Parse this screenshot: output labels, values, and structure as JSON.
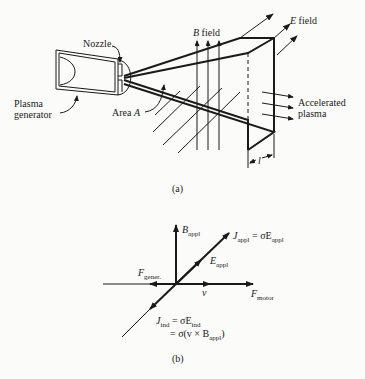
{
  "figure_a": {
    "caption": "(a)",
    "labels": {
      "nozzle": "Nozzle",
      "plasma_generator_line1": "Plasma",
      "plasma_generator_line2": "generator",
      "area": "Area ",
      "area_var": "A",
      "b_field_var": "B",
      "b_field": " field",
      "e_field_var": "E",
      "e_field": " field",
      "accelerated_line1": "Accelerated",
      "accelerated_line2": "plasma",
      "length": "l"
    }
  },
  "figure_b": {
    "caption": "(b)",
    "labels": {
      "b_appl": "B",
      "b_appl_sub": "appl",
      "j_appl": "J",
      "j_appl_sub": "appl",
      "j_appl_eq": " = σE",
      "j_appl_eq_sub": "appl",
      "e_appl": "E",
      "e_appl_sub": "appl",
      "f_gener": "F",
      "f_gener_sub": "gener.",
      "v": "v",
      "f_motor": "F",
      "f_motor_sub": "motor",
      "j_ind": "J",
      "j_ind_sub": "ind",
      "j_ind_eq": " = σE",
      "j_ind_eq_sub": "ind",
      "j_ind_eq2": "= σ(v × B",
      "j_ind_eq2_sub": "appl",
      "j_ind_eq2_end": ")"
    }
  }
}
